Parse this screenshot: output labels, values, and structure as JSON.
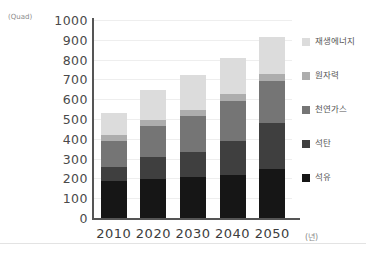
{
  "chart_data": {
    "type": "bar",
    "subtype": "stacked-vertical",
    "title": "",
    "xlabel": "(년)",
    "ylabel": "(Quad)",
    "categories": [
      "2010",
      "2020",
      "2030",
      "2040",
      "2050"
    ],
    "ylim": [
      0,
      1000
    ],
    "ytick_step": 100,
    "yticks": [
      "1000",
      "900",
      "800",
      "700",
      "600",
      "500",
      "400",
      "300",
      "200",
      "100",
      "0"
    ],
    "grid": true,
    "grid_axis": "y",
    "legend_position": "right",
    "stack_order_bottom_to_top": [
      "석유",
      "석탄",
      "천연가스",
      "원자력",
      "재생에너지"
    ],
    "series": [
      {
        "name": "석유",
        "color": "#161616",
        "values": [
          185,
          195,
          205,
          215,
          250
        ]
      },
      {
        "name": "석탄",
        "color": "#3f3f3f",
        "values": [
          75,
          115,
          130,
          175,
          230
        ]
      },
      {
        "name": "천연가스",
        "color": "#757575",
        "values": [
          130,
          155,
          180,
          200,
          210
        ]
      },
      {
        "name": "원자력",
        "color": "#adadad",
        "values": [
          30,
          30,
          30,
          35,
          35
        ]
      },
      {
        "name": "재생에너지",
        "color": "#dcdcdc",
        "values": [
          110,
          150,
          180,
          185,
          190
        ]
      }
    ],
    "totals": [
      530,
      645,
      725,
      810,
      915
    ]
  },
  "axis": {
    "unit_label": "(Quad)",
    "x_unit_label": "(년)"
  },
  "legend": {
    "items": [
      {
        "label": "재생에너지",
        "color": "#dcdcdc"
      },
      {
        "label": "원자력",
        "color": "#adadad"
      },
      {
        "label": "천연가스",
        "color": "#757575"
      },
      {
        "label": "석탄",
        "color": "#3f3f3f"
      },
      {
        "label": "석유",
        "color": "#161616"
      }
    ]
  }
}
